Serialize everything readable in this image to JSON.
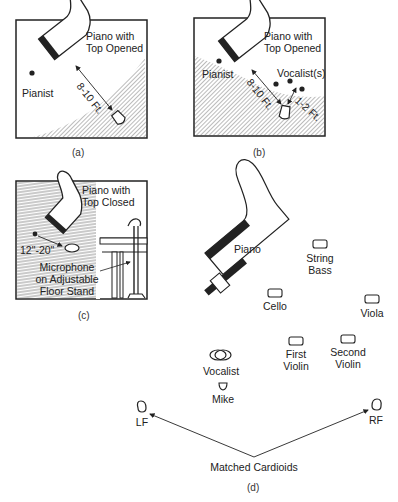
{
  "panels": {
    "a": {
      "caption": "(a)",
      "piano_label_line1": "Piano with",
      "piano_label_line2": "Top Opened",
      "pianist_label": "Pianist",
      "distance_label": "8-10 Ft."
    },
    "b": {
      "caption": "(b)",
      "piano_label_line1": "Piano with",
      "piano_label_line2": "Top Opened",
      "pianist_label": "Pianist",
      "vocalist_label": "Vocalist(s)",
      "distance_label": "8-10 Ft.",
      "vocal_distance_label": "1-2 Ft."
    },
    "c": {
      "caption": "(c)",
      "piano_label_line1": "Piano with",
      "piano_label_line2": "Top Closed",
      "distance_label": "12\"-20\"",
      "mic_label_line1": "Microphone",
      "mic_label_line2": "on Adjustable",
      "mic_label_line3": "Floor Stand"
    },
    "d": {
      "caption": "(d)",
      "piano_label": "Piano",
      "instruments": [
        {
          "name_line1": "String",
          "name_line2": "Bass"
        },
        {
          "name_line1": "Cello",
          "name_line2": ""
        },
        {
          "name_line1": "Viola",
          "name_line2": ""
        },
        {
          "name_line1": "First",
          "name_line2": "Violin"
        },
        {
          "name_line1": "Second",
          "name_line2": "Violin"
        }
      ],
      "vocalist_label": "Vocalist",
      "mike_label": "Mike",
      "left_mic_label": "LF",
      "right_mic_label": "RF",
      "cardioids_label": "Matched Cardioids"
    }
  }
}
